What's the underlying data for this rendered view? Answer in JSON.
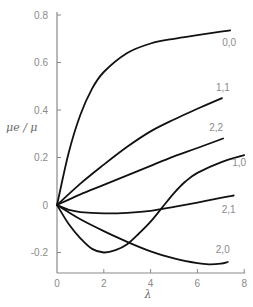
{
  "chart_data": {
    "type": "line",
    "title": "",
    "xlabel": "λ",
    "ylabel": "μe / μ",
    "xlim": [
      0,
      8
    ],
    "ylim": [
      -0.27,
      0.8
    ],
    "grid": false,
    "x_ticks": [
      0,
      2,
      4,
      6,
      8
    ],
    "x_tick_labels": [
      "0",
      "2",
      "4",
      "6",
      "8"
    ],
    "y_ticks": [
      0.8,
      0.6,
      0.4,
      0.2,
      0,
      -0.2
    ],
    "y_tick_labels": [
      "0.8",
      "0.6",
      "0.4",
      "0.2",
      "0",
      "-0.2"
    ],
    "series": [
      {
        "name": "0,0",
        "x": [
          0,
          0.5,
          1,
          1.5,
          2,
          3,
          4,
          5,
          6,
          7,
          7.4
        ],
        "y": [
          0,
          0.22,
          0.38,
          0.49,
          0.56,
          0.64,
          0.68,
          0.7,
          0.715,
          0.73,
          0.735
        ]
      },
      {
        "name": "1,1",
        "x": [
          0,
          1,
          2,
          3,
          4,
          5,
          6,
          7.05
        ],
        "y": [
          0,
          0.09,
          0.17,
          0.245,
          0.31,
          0.36,
          0.405,
          0.45
        ]
      },
      {
        "name": "2,2",
        "x": [
          0,
          1,
          2,
          3,
          4,
          5,
          6,
          7.1
        ],
        "y": [
          0,
          0.045,
          0.085,
          0.125,
          0.165,
          0.205,
          0.24,
          0.28
        ]
      },
      {
        "name": "1,0",
        "x": [
          0,
          0.5,
          1,
          1.5,
          2,
          2.5,
          3,
          3.5,
          4,
          4.5,
          5,
          5.5,
          6,
          7,
          8
        ],
        "y": [
          0,
          -0.08,
          -0.14,
          -0.185,
          -0.2,
          -0.19,
          -0.165,
          -0.12,
          -0.07,
          -0.01,
          0.05,
          0.1,
          0.135,
          0.18,
          0.21
        ]
      },
      {
        "name": "2,1",
        "x": [
          0,
          0.5,
          1,
          2,
          3,
          4,
          5,
          6,
          7,
          7.55
        ],
        "y": [
          0,
          -0.02,
          -0.03,
          -0.035,
          -0.033,
          -0.025,
          -0.008,
          0.01,
          0.03,
          0.04
        ]
      },
      {
        "name": "2,0",
        "x": [
          0,
          1,
          2,
          3,
          4,
          5,
          6,
          6.5,
          7,
          7.3
        ],
        "y": [
          0,
          -0.06,
          -0.11,
          -0.155,
          -0.195,
          -0.225,
          -0.245,
          -0.25,
          -0.247,
          -0.24
        ]
      }
    ],
    "legend": "inline labels at right end of each curve"
  }
}
